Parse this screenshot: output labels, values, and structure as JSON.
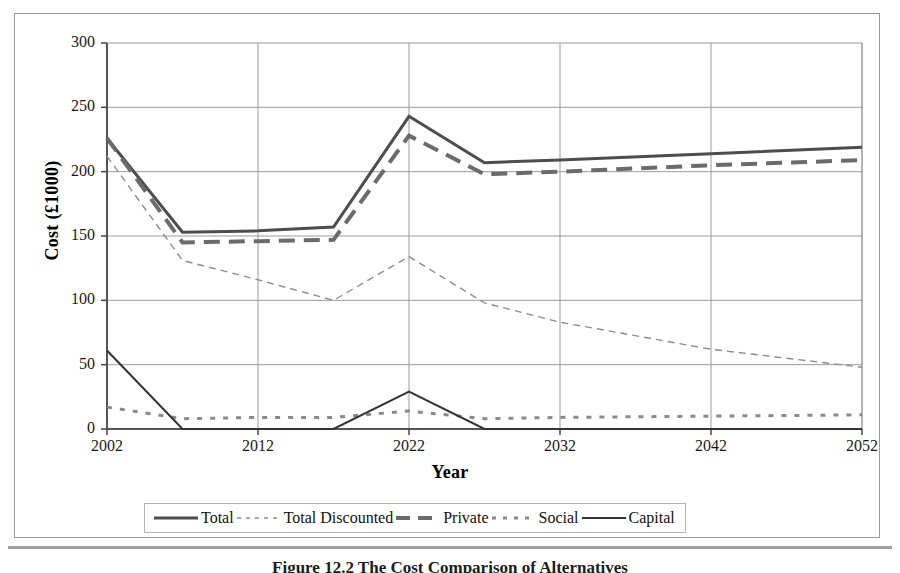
{
  "figure": {
    "caption": "Figure 12.2   The Cost Comparison of Alternatives"
  },
  "chart_data": {
    "type": "line",
    "title": "",
    "xlabel": "Year",
    "ylabel": "Cost (£1000)",
    "xlim": [
      2002,
      2052
    ],
    "ylim": [
      0,
      300
    ],
    "yticks": [
      0,
      50,
      100,
      150,
      200,
      250,
      300
    ],
    "xticks": [
      2002,
      2012,
      2022,
      2032,
      2042,
      2052
    ],
    "grid": true,
    "legend_position": "bottom",
    "x": [
      2002,
      2007,
      2012,
      2017,
      2022,
      2027,
      2032,
      2042,
      2052
    ],
    "series": [
      {
        "name": "Total",
        "style": "solid",
        "color": "#4d4d4d",
        "width": 3,
        "values": [
          226,
          153,
          154,
          157,
          243,
          207,
          209,
          214,
          219
        ]
      },
      {
        "name": "Total Discounted",
        "style": "dashed-thin",
        "color": "#8c8c8c",
        "width": 1.4,
        "values": [
          212,
          131,
          116,
          100,
          134,
          98,
          83,
          62,
          48
        ]
      },
      {
        "name": "Private",
        "style": "dashed-long",
        "color": "#6b6b6b",
        "width": 4,
        "values": [
          226,
          145,
          146,
          147,
          228,
          198,
          200,
          205,
          209
        ]
      },
      {
        "name": "Social",
        "style": "dotted",
        "color": "#8a8a8a",
        "width": 3,
        "values": [
          17,
          8,
          9,
          9,
          14,
          8,
          9,
          10,
          11
        ]
      },
      {
        "name": "Capital",
        "style": "solid-thin",
        "color": "#333333",
        "width": 2,
        "values": [
          61,
          0,
          0,
          0,
          29,
          0,
          0,
          0,
          0
        ]
      }
    ]
  },
  "axis": {
    "y_title": "Cost (£1000)",
    "x_title": "Year",
    "y_tick_labels": [
      "300",
      "250",
      "200",
      "150",
      "100",
      "50",
      "0"
    ],
    "x_tick_labels": [
      "2002",
      "2012",
      "2022",
      "2032",
      "2042",
      "2052"
    ]
  },
  "legend": {
    "items": [
      {
        "label": "Total",
        "swatch": "solid-thick-line-swatch"
      },
      {
        "label": "Total Discounted",
        "swatch": "dotted-thin-line-swatch"
      },
      {
        "label": "Private",
        "swatch": "dashed-thick-line-swatch"
      },
      {
        "label": "Social",
        "swatch": "dotted-square-line-swatch"
      },
      {
        "label": "Capital",
        "swatch": "solid-thin-line-swatch"
      }
    ]
  }
}
